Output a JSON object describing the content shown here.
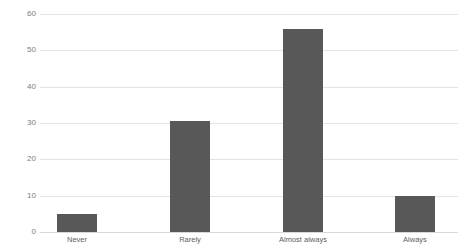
{
  "chart_data": {
    "type": "bar",
    "title": "",
    "subtitle": "",
    "xlabel": "",
    "ylabel": "",
    "categories": [
      "Never",
      "Rarely",
      "Almost always",
      "Always"
    ],
    "values": [
      5,
      30.5,
      56,
      10
    ],
    "series": [
      {
        "name": "",
        "values": [
          5,
          30.5,
          56,
          10
        ],
        "color": "#585858"
      }
    ],
    "ylim": [
      0,
      60
    ],
    "ytick_labels": [
      "0",
      "10",
      "20",
      "30",
      "40",
      "50",
      "60"
    ],
    "ytick_values": [
      0,
      10,
      20,
      30,
      40,
      50,
      60
    ],
    "grid": true,
    "grid_axis": "y",
    "legend": false,
    "legend_position": "none",
    "background_color": "#ffffff",
    "gridline_color": "#e4e4e4",
    "axis_label_color": "#7c7c7c"
  }
}
